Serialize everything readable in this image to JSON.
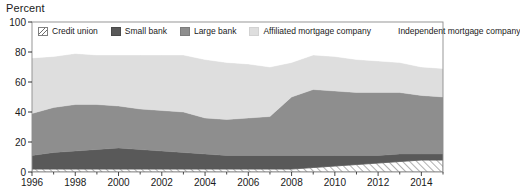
{
  "chart_data": {
    "type": "area",
    "title": "",
    "subtitle": "",
    "ylabel": "Percent",
    "xlabel": "",
    "ylim": [
      0,
      100
    ],
    "xlim": [
      1996,
      2015
    ],
    "grid": false,
    "stacked": true,
    "legend_position": "top-inside",
    "ytick_labels": [
      "0",
      "20",
      "40",
      "60",
      "80",
      "100"
    ],
    "ytick_values": [
      0,
      20,
      40,
      60,
      80,
      100
    ],
    "xtick_labels": [
      "1996",
      "1998",
      "2000",
      "2002",
      "2004",
      "2006",
      "2008",
      "2010",
      "2012",
      "2014"
    ],
    "xtick_values": [
      1996,
      1998,
      2000,
      2002,
      2004,
      2006,
      2008,
      2010,
      2012,
      2014
    ],
    "x": [
      1996,
      1997,
      1998,
      1999,
      2000,
      2001,
      2002,
      2003,
      2004,
      2005,
      2006,
      2007,
      2008,
      2009,
      2010,
      2011,
      2012,
      2013,
      2014,
      2015
    ],
    "series": [
      {
        "name": "Credit union",
        "color": "#ffffff",
        "pattern": "diagonal-hatch",
        "values": [
          2,
          2,
          2,
          2,
          2,
          2,
          2,
          2,
          2,
          2,
          2,
          2,
          2,
          3,
          4,
          5,
          6,
          7,
          8,
          8
        ]
      },
      {
        "name": "Small bank",
        "color": "#595959",
        "pattern": "solid",
        "values": [
          9,
          11,
          12,
          13,
          14,
          13,
          12,
          11,
          10,
          9,
          9,
          9,
          9,
          8,
          7,
          6,
          5,
          5,
          4,
          4
        ]
      },
      {
        "name": "Large bank",
        "color": "#8e8e8e",
        "pattern": "solid",
        "values": [
          28,
          30,
          31,
          30,
          28,
          27,
          27,
          27,
          24,
          24,
          25,
          26,
          39,
          44,
          43,
          42,
          42,
          41,
          39,
          38
        ]
      },
      {
        "name": "Affiliated mortgage company",
        "color": "#dedede",
        "pattern": "solid",
        "values": [
          37,
          34,
          34,
          33,
          34,
          36,
          37,
          38,
          39,
          38,
          36,
          33,
          23,
          23,
          23,
          22,
          21,
          20,
          19,
          19
        ]
      },
      {
        "name": "Independent mortgage company",
        "color": "#ffffff",
        "pattern": "solid",
        "values": [
          24,
          23,
          21,
          22,
          22,
          22,
          22,
          22,
          25,
          27,
          28,
          30,
          27,
          22,
          23,
          25,
          26,
          27,
          30,
          31
        ]
      }
    ]
  },
  "legend": {
    "items": [
      {
        "label": "Credit union",
        "swatch_class": "sw-credit",
        "icon": "hatch-swatch-icon"
      },
      {
        "label": "Small bank",
        "swatch_class": "sw-small",
        "icon": "dark-gray-swatch-icon"
      },
      {
        "label": "Large bank",
        "swatch_class": "sw-large",
        "icon": "mid-gray-swatch-icon"
      },
      {
        "label": "Affiliated mortgage company",
        "swatch_class": "sw-affil",
        "icon": "light-gray-swatch-icon"
      },
      {
        "label": "Independent mortgage company",
        "swatch_class": "sw-indep",
        "icon": "white-swatch-icon"
      }
    ]
  },
  "axis": {
    "y_title": "Percent"
  },
  "colors": {
    "credit_union": "#ffffff",
    "small_bank": "#595959",
    "large_bank": "#8e8e8e",
    "affiliated": "#dedede",
    "independent": "#ffffff",
    "axis": "#1a1a1a",
    "frame": "#8c8c8c"
  }
}
